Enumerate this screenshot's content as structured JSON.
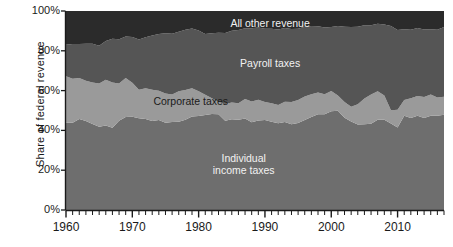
{
  "chart_data": {
    "type": "area",
    "stacked": true,
    "title": "",
    "xlabel": "",
    "ylabel": "Share of  federal revenue",
    "xlim": [
      1960,
      2017
    ],
    "ylim": [
      0,
      100
    ],
    "grid": false,
    "legend_position": "inline-labels",
    "xticks": [
      "1960",
      "1970",
      "1980",
      "1990",
      "2000",
      "2010"
    ],
    "xtick_values": [
      1960,
      1970,
      1980,
      1990,
      2000,
      2010
    ],
    "minor_tick_interval": 1,
    "yticks": [
      "0%",
      "20%",
      "40%",
      "60%",
      "80%",
      "100%"
    ],
    "ytick_values": [
      0,
      20,
      40,
      60,
      80,
      100
    ],
    "x": [
      1960,
      1961,
      1962,
      1963,
      1964,
      1965,
      1966,
      1967,
      1968,
      1969,
      1970,
      1971,
      1972,
      1973,
      1974,
      1975,
      1976,
      1977,
      1978,
      1979,
      1980,
      1981,
      1982,
      1983,
      1984,
      1985,
      1986,
      1987,
      1988,
      1989,
      1990,
      1991,
      1992,
      1993,
      1994,
      1995,
      1996,
      1997,
      1998,
      1999,
      2000,
      2001,
      2002,
      2003,
      2004,
      2005,
      2006,
      2007,
      2008,
      2009,
      2010,
      2011,
      2012,
      2013,
      2014,
      2015,
      2016,
      2017
    ],
    "series": [
      {
        "name": "Individual income taxes",
        "color": "#6e6e6e",
        "label_color": "#f2f2f2",
        "values": [
          44.0,
          43.8,
          45.7,
          44.7,
          43.2,
          41.8,
          42.4,
          41.3,
          44.9,
          46.7,
          46.9,
          46.1,
          45.7,
          44.7,
          45.2,
          43.9,
          44.2,
          44.3,
          45.3,
          47.0,
          47.2,
          47.7,
          48.2,
          48.1,
          44.8,
          45.6,
          45.4,
          46.0,
          44.1,
          45.0,
          45.2,
          44.3,
          43.6,
          44.2,
          43.1,
          43.7,
          45.2,
          46.7,
          48.1,
          48.1,
          49.6,
          49.9,
          46.3,
          44.5,
          43.0,
          43.1,
          43.4,
          45.3,
          45.4,
          43.5,
          41.5,
          47.4,
          46.2,
          47.4,
          46.2,
          47.4,
          47.3,
          47.9
        ]
      },
      {
        "name": "Corporate taxes",
        "color": "#9a9a9a",
        "label_color": "#1b1b1b",
        "values": [
          23.2,
          22.2,
          20.6,
          20.3,
          20.9,
          21.8,
          23.0,
          22.8,
          18.7,
          19.6,
          17.0,
          14.3,
          15.5,
          15.7,
          14.7,
          14.6,
          13.9,
          15.4,
          15.0,
          14.2,
          12.5,
          10.2,
          8.0,
          6.2,
          8.5,
          8.4,
          8.2,
          9.8,
          10.4,
          10.4,
          9.1,
          9.3,
          9.2,
          10.2,
          11.2,
          11.6,
          11.8,
          11.5,
          11.0,
          10.1,
          10.2,
          7.6,
          8.0,
          7.4,
          10.1,
          12.9,
          14.7,
          14.4,
          12.1,
          6.6,
          8.9,
          7.9,
          9.9,
          9.9,
          10.6,
          10.6,
          9.2,
          9.0
        ]
      },
      {
        "name": "Payroll taxes",
        "color": "#555555",
        "label_color": "#f2f2f2",
        "values": [
          15.9,
          17.4,
          17.1,
          18.6,
          19.5,
          19.0,
          19.5,
          22.0,
          22.2,
          20.9,
          23.0,
          25.3,
          25.6,
          27.3,
          28.5,
          30.3,
          30.5,
          29.9,
          30.3,
          30.0,
          30.5,
          30.5,
          32.6,
          34.8,
          35.7,
          36.1,
          36.9,
          35.5,
          36.8,
          36.3,
          36.8,
          37.5,
          37.9,
          37.1,
          36.7,
          35.8,
          35.1,
          34.2,
          33.2,
          33.5,
          32.2,
          34.9,
          37.8,
          40.0,
          39.0,
          36.9,
          34.8,
          33.9,
          35.7,
          42.3,
          40.0,
          35.5,
          34.5,
          34.2,
          33.9,
          32.8,
          34.1,
          35.0
        ]
      },
      {
        "name": "All other revenue",
        "color": "#2b2b2b",
        "label_color": "#f2f2f2",
        "values": [
          16.9,
          16.6,
          16.6,
          16.4,
          16.4,
          17.4,
          15.1,
          13.9,
          14.2,
          12.8,
          13.1,
          14.3,
          13.2,
          12.3,
          11.6,
          11.2,
          11.4,
          10.4,
          9.4,
          8.8,
          9.8,
          11.6,
          11.2,
          10.9,
          11.0,
          9.9,
          9.5,
          8.7,
          8.7,
          8.3,
          8.9,
          8.9,
          9.3,
          8.5,
          9.0,
          8.9,
          7.9,
          7.6,
          7.7,
          8.3,
          8.0,
          7.6,
          7.9,
          8.1,
          7.9,
          7.1,
          7.1,
          6.4,
          6.8,
          7.6,
          9.6,
          9.2,
          9.4,
          8.5,
          9.3,
          9.2,
          9.4,
          8.1
        ]
      }
    ],
    "inline_labels": [
      {
        "name": "All other revenue",
        "text": "All other revenue",
        "x_pct": 54,
        "y_pct": 94
      },
      {
        "name": "Payroll taxes",
        "text": "Payroll taxes",
        "x_pct": 54,
        "y_pct": 74
      },
      {
        "name": "Corporate taxes",
        "text": "Corporate taxes",
        "x_pct": 33,
        "y_pct": 55
      },
      {
        "name": "Individual income taxes",
        "text": "Individual\nincome taxes",
        "x_pct": 47,
        "y_pct": 23
      }
    ],
    "axis_color": "#1a1a1a",
    "background": "#ffffff"
  }
}
